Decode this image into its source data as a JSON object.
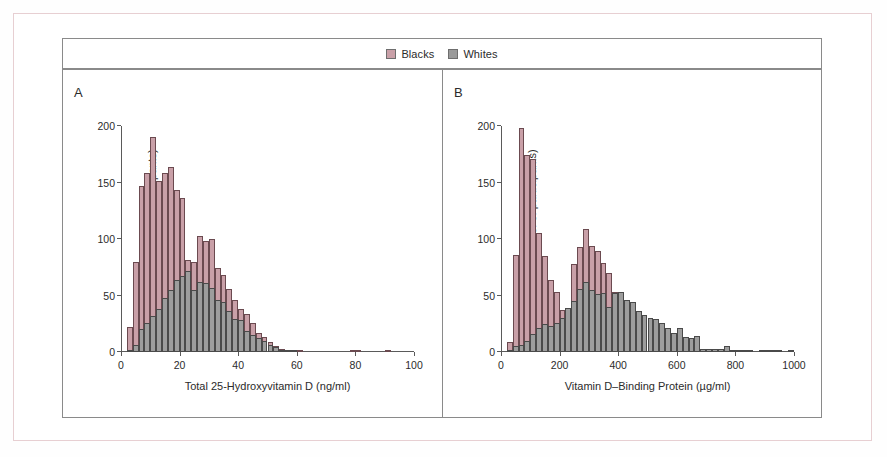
{
  "figure": {
    "legend": {
      "items": [
        {
          "label": "Blacks",
          "color": "#c9a0a8",
          "swatch": "blacks"
        },
        {
          "label": "Whites",
          "color": "#9d9d9d",
          "swatch": "whites"
        }
      ]
    },
    "panels": [
      {
        "letter": "A",
        "xlabel": "Total 25-Hydroxyvitamin D (ng/ml)",
        "ylabel": "Frequency (no. of participants)"
      },
      {
        "letter": "B",
        "xlabel": "Vitamin D–Binding Protein (µg/ml)",
        "ylabel": "Frequency (no. of participants)"
      }
    ]
  },
  "chart_data": [
    {
      "type": "bar",
      "title": "A",
      "xlabel": "Total 25-Hydroxyvitamin D (ng/ml)",
      "ylabel": "Frequency (no. of participants)",
      "xlim": [
        0,
        100
      ],
      "ylim": [
        0,
        200
      ],
      "xticks": [
        0,
        20,
        40,
        60,
        80,
        100
      ],
      "yticks": [
        0,
        50,
        100,
        150,
        200
      ],
      "bin_width": 2,
      "bin_starts": [
        2,
        4,
        6,
        8,
        10,
        12,
        14,
        16,
        18,
        20,
        22,
        24,
        26,
        28,
        30,
        32,
        34,
        36,
        38,
        40,
        42,
        44,
        46,
        48,
        50,
        52,
        54,
        56,
        58,
        60,
        62,
        64,
        66,
        68,
        70,
        72,
        74,
        76,
        78,
        80,
        82,
        84,
        86,
        88,
        90,
        92,
        94,
        96,
        98
      ],
      "series": [
        {
          "name": "Blacks",
          "color": "#c9a0a8",
          "values": [
            22,
            80,
            147,
            158,
            190,
            151,
            158,
            164,
            143,
            136,
            81,
            80,
            103,
            98,
            100,
            74,
            68,
            56,
            46,
            38,
            34,
            26,
            17,
            13,
            9,
            5,
            3,
            2,
            1,
            1,
            0,
            0,
            0,
            0,
            0,
            0,
            0,
            0,
            1,
            1,
            0,
            0,
            0,
            0,
            1,
            0,
            0,
            0,
            0
          ]
        },
        {
          "name": "Whites",
          "color": "#9d9d9d",
          "values": [
            1,
            6,
            20,
            26,
            32,
            38,
            48,
            55,
            64,
            67,
            72,
            55,
            62,
            61,
            57,
            46,
            44,
            36,
            29,
            28,
            19,
            15,
            12,
            10,
            6,
            4,
            2,
            1,
            1,
            0,
            0,
            0,
            0,
            0,
            0,
            0,
            0,
            0,
            0,
            0,
            0,
            0,
            0,
            0,
            0,
            0,
            0,
            0,
            0
          ]
        }
      ]
    },
    {
      "type": "bar",
      "title": "B",
      "xlabel": "Vitamin D–Binding Protein (µg/ml)",
      "ylabel": "Frequency (no. of participants)",
      "xlim": [
        0,
        1000
      ],
      "ylim": [
        0,
        200
      ],
      "xticks": [
        0,
        200,
        400,
        600,
        800,
        1000
      ],
      "yticks": [
        0,
        50,
        100,
        150,
        200
      ],
      "bin_width": 20,
      "bin_starts": [
        20,
        40,
        60,
        80,
        100,
        120,
        140,
        160,
        180,
        200,
        220,
        240,
        260,
        280,
        300,
        320,
        340,
        360,
        380,
        400,
        420,
        440,
        460,
        480,
        500,
        520,
        540,
        560,
        580,
        600,
        620,
        640,
        660,
        680,
        700,
        720,
        740,
        760,
        780,
        800,
        820,
        840,
        860,
        880,
        900,
        920,
        940,
        960,
        980
      ],
      "series": [
        {
          "name": "Blacks",
          "color": "#c9a0a8",
          "values": [
            9,
            86,
            198,
            174,
            171,
            105,
            85,
            64,
            53,
            37,
            30,
            78,
            93,
            109,
            94,
            89,
            79,
            70,
            53,
            53,
            46,
            42,
            33,
            31,
            28,
            23,
            20,
            17,
            13,
            12,
            6,
            5,
            14,
            3,
            3,
            3,
            3,
            5,
            2,
            1,
            1,
            1,
            0,
            1,
            2,
            2,
            1,
            0,
            1
          ]
        },
        {
          "name": "Whites",
          "color": "#9d9d9d",
          "values": [
            1,
            5,
            6,
            10,
            16,
            21,
            25,
            23,
            26,
            30,
            39,
            45,
            56,
            62,
            55,
            51,
            52,
            40,
            52,
            53,
            46,
            44,
            36,
            33,
            30,
            29,
            26,
            21,
            17,
            21,
            13,
            12,
            14,
            3,
            3,
            3,
            3,
            5,
            2,
            1,
            1,
            1,
            0,
            1,
            2,
            2,
            1,
            0,
            1
          ]
        }
      ]
    }
  ]
}
